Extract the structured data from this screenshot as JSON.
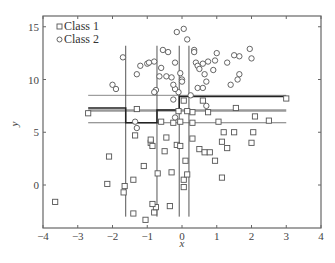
{
  "chart_data": {
    "type": "scatter",
    "title": "",
    "xlabel": "x",
    "ylabel": "y",
    "xlim": [
      -4,
      4
    ],
    "ylim": [
      -4,
      16
    ],
    "xticks": [
      -4,
      -3,
      -2,
      -1,
      0,
      1,
      2,
      3,
      4
    ],
    "yticks": [
      0,
      5,
      10,
      15
    ],
    "xtick_labels": [
      "−4",
      "−3",
      "−2",
      "−1",
      "0",
      "1",
      "2",
      "3",
      "4"
    ],
    "ytick_labels": [
      "0",
      "5",
      "10",
      "15"
    ],
    "grid": false,
    "legend_position": "upper left",
    "series": [
      {
        "name": "Class 1",
        "marker": "square",
        "color": "#555555",
        "points": [
          [
            -3.65,
            -1.6
          ],
          [
            -2.15,
            0.1
          ],
          [
            -2.1,
            2.7
          ],
          [
            -2.7,
            6.8
          ],
          [
            -1.65,
            -0.1
          ],
          [
            -1.68,
            -0.7
          ],
          [
            -1.4,
            0.5
          ],
          [
            -1.4,
            -2.7
          ],
          [
            -1.35,
            4.7
          ],
          [
            -1.1,
            1.8
          ],
          [
            -1.05,
            -3.3
          ],
          [
            -0.8,
            -2.6
          ],
          [
            -0.75,
            -2.1
          ],
          [
            -0.85,
            -1.8
          ],
          [
            -0.7,
            1.1
          ],
          [
            -0.9,
            4.0
          ],
          [
            -0.9,
            4.3
          ],
          [
            -0.85,
            3.7
          ],
          [
            -0.5,
            3.2
          ],
          [
            -0.45,
            4.5
          ],
          [
            -0.3,
            1.2
          ],
          [
            -0.35,
            -2.0
          ],
          [
            -0.15,
            3.8
          ],
          [
            -0.05,
            3.7
          ],
          [
            0.1,
            2.3
          ],
          [
            0.05,
            0.5
          ],
          [
            0.05,
            -0.2
          ],
          [
            0.15,
            1.0
          ],
          [
            0.3,
            4.4
          ],
          [
            0.5,
            3.4
          ],
          [
            0.65,
            3.1
          ],
          [
            0.8,
            3.1
          ],
          [
            0.95,
            2.3
          ],
          [
            1.15,
            4.1
          ],
          [
            1.15,
            0.7
          ],
          [
            1.3,
            3.5
          ],
          [
            1.2,
            5.0
          ],
          [
            1.5,
            5.0
          ],
          [
            2.0,
            4.0
          ],
          [
            2.05,
            5.0
          ],
          [
            -1.3,
            7.2
          ],
          [
            -0.6,
            6.0
          ],
          [
            -0.25,
            5.9
          ],
          [
            0.05,
            8.0
          ],
          [
            0.3,
            6.9
          ],
          [
            0.3,
            5.9
          ],
          [
            0.75,
            6.9
          ],
          [
            1.05,
            6.0
          ],
          [
            1.55,
            7.3
          ],
          [
            2.1,
            6.5
          ],
          [
            2.5,
            6.1
          ],
          [
            3.0,
            8.2
          ],
          [
            0.6,
            8.0
          ],
          [
            -0.1,
            7.0
          ],
          [
            0.15,
            7.0
          ],
          [
            -0.05,
            6.0
          ]
        ]
      },
      {
        "name": "Class 2",
        "marker": "circle",
        "color": "#555555",
        "points": [
          [
            -2.0,
            9.5
          ],
          [
            -1.9,
            9.1
          ],
          [
            -1.7,
            12.1
          ],
          [
            -1.2,
            11.3
          ],
          [
            -1.3,
            10.5
          ],
          [
            -1.0,
            11.5
          ],
          [
            -0.95,
            11.6
          ],
          [
            -0.8,
            11.7
          ],
          [
            -0.6,
            11.1
          ],
          [
            -0.65,
            10.3
          ],
          [
            -0.75,
            9.0
          ],
          [
            -1.35,
            6.0
          ],
          [
            -0.15,
            14.5
          ],
          [
            0.05,
            14.8
          ],
          [
            0.15,
            13.8
          ],
          [
            0.35,
            12.8
          ],
          [
            0.4,
            11.6
          ],
          [
            0.45,
            11.3
          ],
          [
            0.6,
            11.5
          ],
          [
            0.65,
            10.5
          ],
          [
            0.7,
            9.8
          ],
          [
            0.75,
            11.7
          ],
          [
            0.95,
            11.8
          ],
          [
            1.3,
            11.6
          ],
          [
            1.5,
            12.3
          ],
          [
            1.95,
            12.9
          ],
          [
            2.0,
            12.0
          ],
          [
            1.6,
            10.0
          ],
          [
            1.65,
            10.5
          ],
          [
            1.4,
            9.5
          ],
          [
            0.45,
            9.2
          ],
          [
            0.6,
            9.2
          ],
          [
            0.25,
            8.5
          ],
          [
            -0.1,
            8.8
          ],
          [
            -0.2,
            9.1
          ],
          [
            0.0,
            10.0
          ],
          [
            -0.25,
            8.1
          ],
          [
            -0.45,
            10.3
          ],
          [
            -0.3,
            10.2
          ],
          [
            -0.2,
            11.6
          ],
          [
            -0.4,
            12.6
          ],
          [
            -0.55,
            12.8
          ],
          [
            0.35,
            12.6
          ],
          [
            0.9,
            10.9
          ],
          [
            -0.05,
            10.6
          ],
          [
            0.5,
            11.0
          ],
          [
            1.0,
            12.5
          ],
          [
            1.65,
            12.2
          ],
          [
            -0.8,
            8.8
          ],
          [
            0.7,
            7.5
          ],
          [
            -1.3,
            5.4
          ],
          [
            -0.2,
            6.4
          ],
          [
            0.0,
            9.8
          ],
          [
            -0.25,
            9.5
          ]
        ]
      }
    ],
    "vertical_lines": [
      {
        "x": -1.62,
        "y_from": -3.0,
        "y_to": 13.2,
        "color": "#555555"
      },
      {
        "x": -0.72,
        "y_from": -3.0,
        "y_to": 13.2,
        "color": "#555555"
      },
      {
        "x": -0.08,
        "y_from": -3.0,
        "y_to": 13.2,
        "color": "#555555"
      },
      {
        "x": 0.2,
        "y_from": -3.0,
        "y_to": 13.2,
        "color": "#555555"
      }
    ],
    "horizontal_lines": [
      {
        "y": 8.5,
        "x_from": -2.7,
        "x_to": 3.0,
        "color": "#888888",
        "width": 1
      },
      {
        "y": 7.05,
        "x_from": -2.7,
        "x_to": 3.0,
        "color": "#999999",
        "width": 2.5
      },
      {
        "y": 5.9,
        "x_from": -2.7,
        "x_to": 3.0,
        "color": "#777777",
        "width": 1
      }
    ],
    "step_boundary": {
      "color": "#222222",
      "points": [
        [
          -2.7,
          7.3
        ],
        [
          -1.62,
          7.3
        ],
        [
          -1.62,
          5.9
        ],
        [
          -0.72,
          5.9
        ],
        [
          -0.72,
          7.1
        ],
        [
          -0.08,
          7.1
        ],
        [
          -0.08,
          8.4
        ],
        [
          3.0,
          8.4
        ]
      ]
    },
    "legend": [
      "Class 1",
      "Class 2"
    ]
  }
}
